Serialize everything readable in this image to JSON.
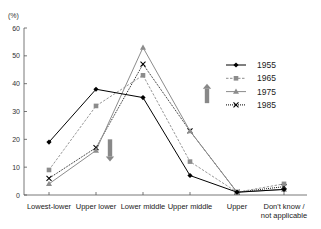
{
  "chart_data": {
    "type": "line",
    "title": "",
    "ylabel": "(%)",
    "xlabel": "",
    "ylim": [
      0,
      60
    ],
    "yticks": [
      0,
      10,
      20,
      30,
      40,
      50,
      60
    ],
    "grid": false,
    "legend_position": "right",
    "categories": [
      [
        "Lowest-lower"
      ],
      [
        "Upper lower"
      ],
      [
        "Lower middle"
      ],
      [
        "Upper middle"
      ],
      [
        "Upper"
      ],
      [
        "Don't know /",
        "not applicable"
      ]
    ],
    "series": [
      {
        "name": "1955",
        "marker": "diamond",
        "color": "#000000",
        "dash": "solid",
        "values": [
          19,
          38,
          35,
          7,
          1,
          2
        ]
      },
      {
        "name": "1965",
        "marker": "square",
        "color": "#8c8c8c",
        "dash": "dashed",
        "values": [
          9,
          32,
          43,
          12,
          1,
          4
        ]
      },
      {
        "name": "1975",
        "marker": "triangle",
        "color": "#8c8c8c",
        "dash": "solid",
        "values": [
          4,
          16,
          53,
          23,
          1,
          2
        ]
      },
      {
        "name": "1985",
        "marker": "x",
        "color": "#000000",
        "dash": "dotted",
        "values": [
          6,
          17,
          47,
          23,
          1,
          3
        ]
      }
    ],
    "annotations": [
      {
        "type": "arrow",
        "direction": "down",
        "category_index": 1,
        "y_from": 20,
        "y_to": 12,
        "color": "#888888"
      },
      {
        "type": "arrow",
        "direction": "up",
        "category_index": 3,
        "y_from": 33,
        "y_to": 40,
        "color": "#888888"
      }
    ]
  }
}
